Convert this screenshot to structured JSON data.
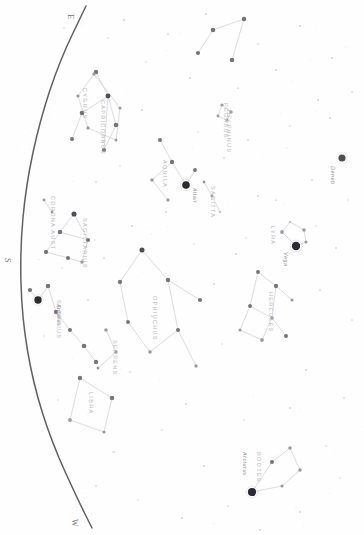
{
  "chart_data": {
    "type": "scatter",
    "subtitle": "Rotated planisphere view of summer constellations",
    "xlabel": "",
    "ylabel": "",
    "xlim": [
      0,
      364
    ],
    "ylim": [
      0,
      535
    ],
    "grid": false,
    "legend": "none",
    "orientation": "rotated-90",
    "background_color": "#fefefe",
    "star_color": "#6a6a70",
    "line_color": "#d2d2d7",
    "label_color": "#b9b9bd",
    "horizon_color": "#4a4a52",
    "horizon_arc": {
      "description": "dark horizon boundary arc sweeping from top-center to bottom-left",
      "points": [
        [
          86,
          6
        ],
        [
          60,
          60
        ],
        [
          40,
          120
        ],
        [
          26,
          185
        ],
        [
          20,
          250
        ],
        [
          22,
          318
        ],
        [
          33,
          383
        ],
        [
          52,
          443
        ],
        [
          78,
          500
        ],
        [
          92,
          528
        ]
      ]
    },
    "compass_marks": [
      {
        "label": "E",
        "x": 75,
        "y": 14,
        "rotation": 90
      },
      {
        "label": "S",
        "x": 12,
        "y": 258,
        "rotation": 90
      },
      {
        "label": "W",
        "x": 79,
        "y": 519,
        "rotation": 90
      }
    ],
    "constellations": [
      {
        "name": "CYGNUS",
        "label_x": 88,
        "label_y": 88,
        "stars": [
          {
            "x": 96,
            "y": 72,
            "mag": 2.6
          },
          {
            "x": 108,
            "y": 96,
            "mag": 2.2
          },
          {
            "x": 82,
            "y": 113,
            "mag": 2.5
          },
          {
            "x": 116,
            "y": 125,
            "mag": 2.4
          },
          {
            "x": 72,
            "y": 139,
            "mag": 3.0
          },
          {
            "x": 104,
            "y": 150,
            "mag": 2.9
          }
        ],
        "lines": [
          [
            0,
            1
          ],
          [
            1,
            2
          ],
          [
            1,
            3
          ],
          [
            2,
            4
          ],
          [
            3,
            5
          ],
          [
            1,
            5
          ]
        ]
      },
      {
        "name": "PEGASUS",
        "label_x": 229,
        "label_y": 103,
        "stars": [
          {
            "x": 213,
            "y": 30,
            "mag": 2.5
          },
          {
            "x": 244,
            "y": 19,
            "mag": 2.6
          },
          {
            "x": 198,
            "y": 53,
            "mag": 2.9
          },
          {
            "x": 232,
            "y": 60,
            "mag": 2.4
          }
        ],
        "lines": [
          [
            0,
            1
          ],
          [
            0,
            2
          ],
          [
            1,
            3
          ]
        ]
      },
      {
        "name": "DELPHINUS",
        "label_x": 232,
        "label_y": 110,
        "stars": [
          {
            "x": 222,
            "y": 105,
            "mag": 3.8
          },
          {
            "x": 231,
            "y": 112,
            "mag": 3.6
          },
          {
            "x": 227,
            "y": 120,
            "mag": 4.0
          },
          {
            "x": 218,
            "y": 116,
            "mag": 4.1
          }
        ],
        "lines": [
          [
            0,
            1
          ],
          [
            1,
            2
          ],
          [
            2,
            3
          ],
          [
            3,
            0
          ]
        ]
      },
      {
        "name": "AQUILA",
        "label_x": 168,
        "label_y": 160,
        "stars": [
          {
            "x": 160,
            "y": 140,
            "mag": 3.0
          },
          {
            "x": 172,
            "y": 162,
            "mag": 2.7
          },
          {
            "x": 186,
            "y": 185,
            "mag": 0.8
          },
          {
            "x": 152,
            "y": 180,
            "mag": 3.4
          },
          {
            "x": 168,
            "y": 200,
            "mag": 3.7
          },
          {
            "x": 195,
            "y": 170,
            "mag": 3.2
          }
        ],
        "lines": [
          [
            0,
            1
          ],
          [
            1,
            2
          ],
          [
            1,
            3
          ],
          [
            3,
            4
          ],
          [
            2,
            5
          ]
        ]
      },
      {
        "name": "SAGITTA",
        "label_x": 216,
        "label_y": 186,
        "stars": [
          {
            "x": 204,
            "y": 182,
            "mag": 4.2
          },
          {
            "x": 212,
            "y": 196,
            "mag": 4.0
          },
          {
            "x": 220,
            "y": 212,
            "mag": 4.3
          }
        ],
        "lines": [
          [
            0,
            1
          ],
          [
            1,
            2
          ]
        ]
      },
      {
        "name": "LYRA",
        "label_x": 276,
        "label_y": 226,
        "stars": [
          {
            "x": 296,
            "y": 246,
            "mag": 0.0
          },
          {
            "x": 282,
            "y": 232,
            "mag": 3.3
          },
          {
            "x": 290,
            "y": 222,
            "mag": 4.3
          },
          {
            "x": 304,
            "y": 230,
            "mag": 3.5
          },
          {
            "x": 306,
            "y": 242,
            "mag": 4.0
          }
        ],
        "lines": [
          [
            0,
            1
          ],
          [
            1,
            2
          ],
          [
            2,
            3
          ],
          [
            3,
            4
          ],
          [
            4,
            0
          ]
        ]
      },
      {
        "name": "HERCULES",
        "label_x": 274,
        "label_y": 292,
        "stars": [
          {
            "x": 258,
            "y": 272,
            "mag": 3.1
          },
          {
            "x": 276,
            "y": 286,
            "mag": 2.8
          },
          {
            "x": 250,
            "y": 306,
            "mag": 3.2
          },
          {
            "x": 272,
            "y": 318,
            "mag": 3.5
          },
          {
            "x": 292,
            "y": 300,
            "mag": 3.8
          },
          {
            "x": 262,
            "y": 340,
            "mag": 3.3
          },
          {
            "x": 240,
            "y": 330,
            "mag": 3.9
          },
          {
            "x": 286,
            "y": 336,
            "mag": 3.0
          }
        ],
        "lines": [
          [
            0,
            1
          ],
          [
            1,
            4
          ],
          [
            0,
            2
          ],
          [
            2,
            3
          ],
          [
            3,
            5
          ],
          [
            5,
            6
          ],
          [
            3,
            7
          ],
          [
            1,
            3
          ],
          [
            6,
            2
          ]
        ]
      },
      {
        "name": "OPHIUCHUS",
        "label_x": 158,
        "label_y": 296,
        "stars": [
          {
            "x": 142,
            "y": 250,
            "mag": 2.1
          },
          {
            "x": 120,
            "y": 282,
            "mag": 2.8
          },
          {
            "x": 168,
            "y": 280,
            "mag": 2.6
          },
          {
            "x": 128,
            "y": 322,
            "mag": 3.2
          },
          {
            "x": 178,
            "y": 330,
            "mag": 3.0
          },
          {
            "x": 150,
            "y": 352,
            "mag": 3.4
          },
          {
            "x": 200,
            "y": 300,
            "mag": 2.9
          },
          {
            "x": 196,
            "y": 366,
            "mag": 3.6
          }
        ],
        "lines": [
          [
            0,
            1
          ],
          [
            0,
            2
          ],
          [
            1,
            3
          ],
          [
            2,
            6
          ],
          [
            3,
            5
          ],
          [
            5,
            4
          ],
          [
            4,
            7
          ],
          [
            2,
            4
          ]
        ]
      },
      {
        "name": "SERPENS",
        "label_x": 118,
        "label_y": 340,
        "stars": [
          {
            "x": 106,
            "y": 330,
            "mag": 3.4
          },
          {
            "x": 116,
            "y": 352,
            "mag": 3.7
          },
          {
            "x": 98,
            "y": 368,
            "mag": 4.0
          }
        ],
        "lines": [
          [
            0,
            1
          ],
          [
            1,
            2
          ]
        ]
      },
      {
        "name": "SCORPIUS",
        "label_x": 62,
        "label_y": 300,
        "stars": [
          {
            "x": 48,
            "y": 286,
            "mag": 2.6
          },
          {
            "x": 38,
            "y": 300,
            "mag": 1.0
          },
          {
            "x": 30,
            "y": 290,
            "mag": 2.9
          },
          {
            "x": 56,
            "y": 312,
            "mag": 2.8
          },
          {
            "x": 70,
            "y": 330,
            "mag": 3.1
          },
          {
            "x": 84,
            "y": 346,
            "mag": 2.4
          },
          {
            "x": 96,
            "y": 362,
            "mag": 2.7
          }
        ],
        "lines": [
          [
            2,
            1
          ],
          [
            1,
            0
          ],
          [
            0,
            3
          ],
          [
            3,
            4
          ],
          [
            4,
            5
          ],
          [
            5,
            6
          ]
        ]
      },
      {
        "name": "LIBRA",
        "label_x": 94,
        "label_y": 392,
        "stars": [
          {
            "x": 80,
            "y": 378,
            "mag": 2.7
          },
          {
            "x": 112,
            "y": 398,
            "mag": 2.6
          },
          {
            "x": 70,
            "y": 420,
            "mag": 3.3
          },
          {
            "x": 104,
            "y": 432,
            "mag": 3.9
          }
        ],
        "lines": [
          [
            0,
            1
          ],
          [
            0,
            2
          ],
          [
            2,
            3
          ],
          [
            1,
            3
          ]
        ]
      },
      {
        "name": "BOOTES",
        "label_x": 262,
        "label_y": 452,
        "stars": [
          {
            "x": 252,
            "y": 492,
            "mag": 0.2
          },
          {
            "x": 272,
            "y": 462,
            "mag": 3.0
          },
          {
            "x": 290,
            "y": 448,
            "mag": 3.5
          },
          {
            "x": 300,
            "y": 470,
            "mag": 3.6
          },
          {
            "x": 282,
            "y": 486,
            "mag": 3.8
          }
        ],
        "lines": [
          [
            0,
            1
          ],
          [
            1,
            2
          ],
          [
            2,
            3
          ],
          [
            3,
            4
          ],
          [
            4,
            0
          ]
        ]
      },
      {
        "name": "SAGITTARIUS",
        "label_x": 88,
        "label_y": 218,
        "stars": [
          {
            "x": 74,
            "y": 214,
            "mag": 2.0
          },
          {
            "x": 60,
            "y": 232,
            "mag": 2.6
          },
          {
            "x": 46,
            "y": 252,
            "mag": 2.8
          },
          {
            "x": 68,
            "y": 258,
            "mag": 3.0
          },
          {
            "x": 88,
            "y": 240,
            "mag": 2.9
          },
          {
            "x": 82,
            "y": 262,
            "mag": 3.4
          }
        ],
        "lines": [
          [
            0,
            1
          ],
          [
            1,
            2
          ],
          [
            2,
            3
          ],
          [
            3,
            5
          ],
          [
            5,
            4
          ],
          [
            4,
            0
          ],
          [
            1,
            4
          ]
        ]
      },
      {
        "name": "CORONA AUST",
        "label_x": 56,
        "label_y": 196,
        "stars": [
          {
            "x": 44,
            "y": 200,
            "mag": 4.1
          },
          {
            "x": 52,
            "y": 212,
            "mag": 4.2
          }
        ],
        "lines": [
          [
            0,
            1
          ]
        ]
      },
      {
        "name": "CAPRICORNUS",
        "label_x": 106,
        "label_y": 100,
        "stars": [
          {
            "x": 94,
            "y": 74,
            "mag": 3.6
          },
          {
            "x": 78,
            "y": 96,
            "mag": 3.8
          },
          {
            "x": 88,
            "y": 128,
            "mag": 3.7
          },
          {
            "x": 116,
            "y": 140,
            "mag": 4.0
          },
          {
            "x": 120,
            "y": 108,
            "mag": 3.9
          }
        ],
        "lines": [
          [
            0,
            1
          ],
          [
            1,
            2
          ],
          [
            2,
            3
          ],
          [
            3,
            4
          ],
          [
            4,
            0
          ]
        ]
      }
    ],
    "named_stars": [
      {
        "name": "Deneb",
        "x": 342,
        "y": 158,
        "mag": 1.2,
        "label_x": 336,
        "label_y": 166
      },
      {
        "name": "Vega",
        "x": 296,
        "y": 246,
        "mag": 0.0,
        "label_x": 289,
        "label_y": 252
      },
      {
        "name": "Altair",
        "x": 186,
        "y": 185,
        "mag": 0.8,
        "label_x": 198,
        "label_y": 188
      },
      {
        "name": "Antares",
        "x": 38,
        "y": 300,
        "mag": 1.0,
        "label_x": 62,
        "label_y": 304
      },
      {
        "name": "Arcturus",
        "x": 252,
        "y": 492,
        "mag": 0.2,
        "label_x": 248,
        "label_y": 452
      }
    ],
    "field_stars": [
      {
        "x": 124,
        "y": 20,
        "mag": 5.0
      },
      {
        "x": 168,
        "y": 34,
        "mag": 5.2
      },
      {
        "x": 206,
        "y": 14,
        "mag": 5.1
      },
      {
        "x": 258,
        "y": 44,
        "mag": 5.3
      },
      {
        "x": 300,
        "y": 26,
        "mag": 5.0
      },
      {
        "x": 332,
        "y": 58,
        "mag": 5.2
      },
      {
        "x": 146,
        "y": 62,
        "mag": 5.4
      },
      {
        "x": 190,
        "y": 78,
        "mag": 5.1
      },
      {
        "x": 238,
        "y": 88,
        "mag": 5.3
      },
      {
        "x": 276,
        "y": 70,
        "mag": 5.2
      },
      {
        "x": 318,
        "y": 100,
        "mag": 5.0
      },
      {
        "x": 108,
        "y": 38,
        "mag": 5.3
      },
      {
        "x": 64,
        "y": 28,
        "mag": 5.5
      },
      {
        "x": 142,
        "y": 110,
        "mag": 5.2
      },
      {
        "x": 198,
        "y": 132,
        "mag": 5.4
      },
      {
        "x": 248,
        "y": 140,
        "mag": 5.1
      },
      {
        "x": 290,
        "y": 126,
        "mag": 5.3
      },
      {
        "x": 330,
        "y": 118,
        "mag": 5.2
      },
      {
        "x": 120,
        "y": 166,
        "mag": 5.4
      },
      {
        "x": 166,
        "y": 212,
        "mag": 5.2
      },
      {
        "x": 224,
        "y": 158,
        "mag": 5.3
      },
      {
        "x": 258,
        "y": 196,
        "mag": 5.1
      },
      {
        "x": 312,
        "y": 180,
        "mag": 5.2
      },
      {
        "x": 348,
        "y": 200,
        "mag": 5.4
      },
      {
        "x": 96,
        "y": 182,
        "mag": 5.3
      },
      {
        "x": 132,
        "y": 226,
        "mag": 5.2
      },
      {
        "x": 194,
        "y": 244,
        "mag": 5.4
      },
      {
        "x": 236,
        "y": 254,
        "mag": 5.1
      },
      {
        "x": 276,
        "y": 200,
        "mag": 5.3
      },
      {
        "x": 336,
        "y": 248,
        "mag": 5.2
      },
      {
        "x": 62,
        "y": 268,
        "mag": 5.4
      },
      {
        "x": 104,
        "y": 258,
        "mag": 5.2
      },
      {
        "x": 152,
        "y": 316,
        "mag": 5.3
      },
      {
        "x": 214,
        "y": 284,
        "mag": 5.1
      },
      {
        "x": 246,
        "y": 238,
        "mag": 5.4
      },
      {
        "x": 320,
        "y": 290,
        "mag": 5.2
      },
      {
        "x": 352,
        "y": 320,
        "mag": 5.3
      },
      {
        "x": 44,
        "y": 336,
        "mag": 5.4
      },
      {
        "x": 88,
        "y": 300,
        "mag": 5.2
      },
      {
        "x": 130,
        "y": 372,
        "mag": 5.3
      },
      {
        "x": 186,
        "y": 404,
        "mag": 5.1
      },
      {
        "x": 222,
        "y": 344,
        "mag": 5.4
      },
      {
        "x": 306,
        "y": 370,
        "mag": 5.2
      },
      {
        "x": 344,
        "y": 398,
        "mag": 5.3
      },
      {
        "x": 58,
        "y": 400,
        "mag": 5.4
      },
      {
        "x": 114,
        "y": 452,
        "mag": 5.2
      },
      {
        "x": 162,
        "y": 430,
        "mag": 5.3
      },
      {
        "x": 204,
        "y": 466,
        "mag": 5.1
      },
      {
        "x": 244,
        "y": 420,
        "mag": 5.4
      },
      {
        "x": 290,
        "y": 408,
        "mag": 5.2
      },
      {
        "x": 326,
        "y": 446,
        "mag": 5.3
      },
      {
        "x": 138,
        "y": 500,
        "mag": 5.4
      },
      {
        "x": 182,
        "y": 518,
        "mag": 5.2
      },
      {
        "x": 228,
        "y": 506,
        "mag": 5.3
      },
      {
        "x": 300,
        "y": 512,
        "mag": 5.1
      },
      {
        "x": 340,
        "y": 478,
        "mag": 5.4
      },
      {
        "x": 96,
        "y": 486,
        "mag": 5.3
      },
      {
        "x": 260,
        "y": 530,
        "mag": 5.2
      },
      {
        "x": 352,
        "y": 92,
        "mag": 5.3
      },
      {
        "x": 316,
        "y": 226,
        "mag": 5.4
      }
    ]
  }
}
